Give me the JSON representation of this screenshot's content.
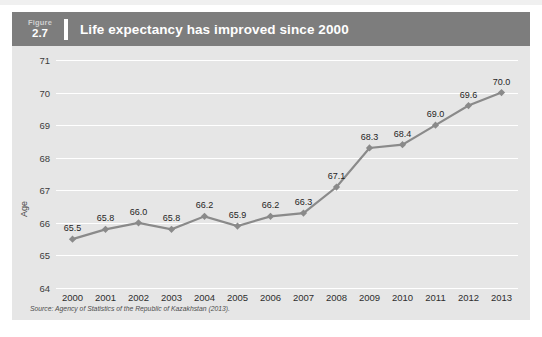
{
  "figure": {
    "label_word": "Figure",
    "number": "2.7",
    "title": "Life expectancy has improved since 2000"
  },
  "source": "Source: Agency of Statistics of the Republic of Kazakhstan (2013).",
  "colors": {
    "header_bar": "#7d7d7d",
    "panel_background": "#e6e6e6",
    "series_line": "#8a8a8a",
    "gridline": "#ffffff",
    "title_text": "#ffffff",
    "tick_text": "#3c3c3c"
  },
  "chart_data": {
    "type": "line",
    "title": "Life expectancy has improved since 2000",
    "xlabel": "",
    "ylabel": "Age",
    "categories": [
      "2000",
      "2001",
      "2002",
      "2003",
      "2004",
      "2005",
      "2006",
      "2007",
      "2008",
      "2009",
      "2010",
      "2011",
      "2012",
      "2013"
    ],
    "values": [
      65.5,
      65.8,
      66.0,
      65.8,
      66.2,
      65.9,
      66.2,
      66.3,
      67.1,
      68.3,
      68.4,
      69.0,
      69.6,
      70.0
    ],
    "data_labels": [
      "65.5",
      "65.8",
      "66.0",
      "65.8",
      "66.2",
      "65.9",
      "66.2",
      "66.3",
      "67.1",
      "68.3",
      "68.4",
      "69.0",
      "69.6",
      "70.0"
    ],
    "ylim": [
      64,
      71
    ],
    "yticks": [
      71,
      70,
      69,
      68,
      67,
      66,
      65,
      64
    ],
    "ytick_labels": [
      "71",
      "70",
      "69",
      "68",
      "67",
      "66",
      "65",
      "64"
    ],
    "grid": true,
    "legend": false,
    "marker": "diamond",
    "series": [
      {
        "name": "Life expectancy",
        "values": [
          65.5,
          65.8,
          66.0,
          65.8,
          66.2,
          65.9,
          66.2,
          66.3,
          67.1,
          68.3,
          68.4,
          69.0,
          69.6,
          70.0
        ]
      }
    ]
  }
}
